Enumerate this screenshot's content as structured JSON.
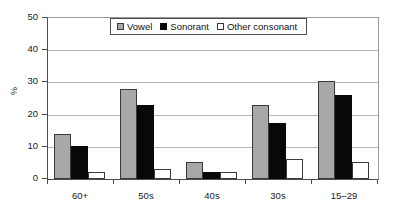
{
  "chart_data": {
    "type": "bar",
    "title": "",
    "xlabel": "",
    "ylabel": "%",
    "ylim": [
      0,
      50
    ],
    "yticks": [
      0,
      10,
      20,
      30,
      40,
      50
    ],
    "grid": true,
    "legend_position": "top-center",
    "categories": [
      "60+",
      "50s",
      "40s",
      "30s",
      "15–29"
    ],
    "series": [
      {
        "name": "Vowel",
        "color": "#a8a8a8",
        "values": [
          14.0,
          28.1,
          5.2,
          23.1,
          30.3
        ]
      },
      {
        "name": "Sonorant",
        "color": "#080808",
        "values": [
          10.1,
          23.1,
          2.1,
          17.3,
          26.2
        ]
      },
      {
        "name": "Other consonant",
        "color": "#ffffff",
        "values": [
          2.1,
          3.2,
          2.1,
          6.2,
          5.4
        ]
      }
    ]
  },
  "axis": {
    "y_title": "%",
    "y_tick_labels": [
      "50",
      "40",
      "30",
      "20",
      "10",
      "0"
    ],
    "x_tick_labels": [
      "60+",
      "50s",
      "40s",
      "30s",
      "15–29"
    ]
  },
  "legend": {
    "items": [
      {
        "label": "Vowel",
        "swatch": "vowel-swatch"
      },
      {
        "label": "Sonorant",
        "swatch": "sonorant-swatch"
      },
      {
        "label": "Other consonant",
        "swatch": "other-consonant-swatch"
      }
    ]
  },
  "colors": {
    "vowel": "#a8a8a8",
    "sonorant": "#080808",
    "other_consonant": "#ffffff",
    "axis": "#4d4d4d",
    "gridline": "#b7b7b7",
    "text": "#1a1a1a"
  }
}
